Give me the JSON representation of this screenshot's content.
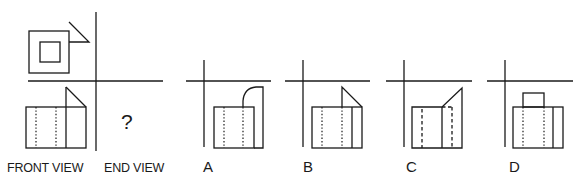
{
  "puzzle": {
    "question_mark": "?",
    "labels": {
      "front_view": "FRONT VIEW",
      "end_view": "END VIEW"
    },
    "options": [
      {
        "id": "A",
        "label": "A"
      },
      {
        "id": "B",
        "label": "B"
      },
      {
        "id": "C",
        "label": "C"
      },
      {
        "id": "D",
        "label": "D"
      }
    ]
  },
  "colors": {
    "line": "#1a1a1a",
    "background": "#ffffff"
  }
}
